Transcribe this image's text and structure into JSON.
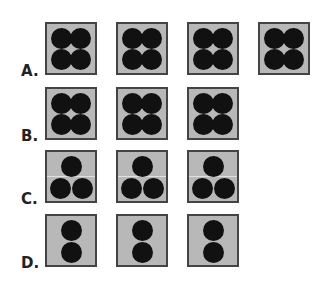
{
  "options": [
    {
      "label": "A.",
      "pattern": "four",
      "count": 4,
      "top": 22,
      "label_top": 62,
      "lefts": [
        45,
        116,
        187,
        258
      ]
    },
    {
      "label": "B.",
      "pattern": "four",
      "count": 3,
      "top": 87,
      "label_top": 127,
      "lefts": [
        45,
        116,
        187
      ]
    },
    {
      "label": "C.",
      "pattern": "three",
      "count": 3,
      "top": 150,
      "label_top": 190,
      "lefts": [
        45,
        116,
        187
      ]
    },
    {
      "label": "D.",
      "pattern": "two",
      "count": 3,
      "top": 214,
      "label_top": 254,
      "lefts": [
        45,
        116,
        187
      ]
    }
  ],
  "colors": {
    "box": "#b8b8b8",
    "border": "#444444",
    "dot": "#111111"
  }
}
